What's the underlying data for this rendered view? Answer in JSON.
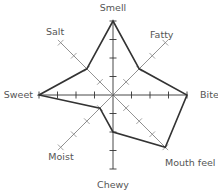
{
  "chart_data": {
    "type": "radar",
    "title": "",
    "categories": [
      "Smell",
      "Fatty",
      "Bite",
      "Mouth feel",
      "Chewy",
      "Moist",
      "Sweet",
      "Salt"
    ],
    "series": [
      {
        "name": "Profile",
        "values": [
          4,
          2,
          4,
          4,
          2,
          1,
          4,
          2
        ]
      }
    ],
    "scale": {
      "min": 0,
      "max": 4,
      "ticks": [
        1,
        2,
        3,
        4
      ]
    },
    "grid": false,
    "legend": "none"
  },
  "colors": {
    "axis_cardinal": "#333333",
    "axis_diagonal": "#888888",
    "series_line": "#333333",
    "label": "#555555"
  },
  "layout": {
    "center": [
      113,
      95
    ],
    "radius": 74
  }
}
